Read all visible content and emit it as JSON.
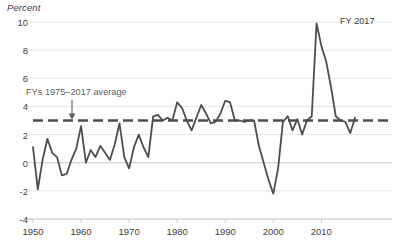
{
  "chart_data": {
    "type": "line",
    "title": "",
    "xlabel": "",
    "ylabel": "Percent",
    "ylim": [
      -4,
      10
    ],
    "xlim": [
      1950,
      2017
    ],
    "yticks": [
      10,
      8,
      6,
      4,
      2,
      0,
      -2,
      -4
    ],
    "ytick_labels": [
      "10",
      "8",
      "6",
      "4",
      "2",
      "0",
      "-2",
      "-4"
    ],
    "xticks": [
      1950,
      1960,
      1970,
      1980,
      1990,
      2000,
      2010
    ],
    "xtick_labels": [
      "1950",
      "1960",
      "1970",
      "1980",
      "1990",
      "2000",
      "2010"
    ],
    "grid": "horizontal",
    "legend": "none",
    "line_color": "#4d4d4d",
    "grid_color": "#e6e6e6",
    "zero_line_color": "#c9c9c9",
    "annotations": [
      {
        "name": "average-annotation",
        "text": "FYs 1975–2017 average",
        "value": 3.0,
        "style": "dashed",
        "color": "#4d4d4d"
      },
      {
        "name": "endpoint-label",
        "text": "FY 2017",
        "x": 2017,
        "color": "#3d3d3d"
      }
    ],
    "series": [
      {
        "name": "annual growth",
        "x": [
          1950,
          1951,
          1952,
          1953,
          1954,
          1955,
          1956,
          1957,
          1958,
          1959,
          1960,
          1961,
          1962,
          1963,
          1964,
          1965,
          1966,
          1967,
          1968,
          1969,
          1970,
          1971,
          1972,
          1973,
          1974,
          1975,
          1976,
          1977,
          1978,
          1979,
          1980,
          1981,
          1982,
          1983,
          1984,
          1985,
          1986,
          1987,
          1988,
          1989,
          1990,
          1991,
          1992,
          1993,
          1994,
          1995,
          1996,
          1997,
          1998,
          1999,
          2000,
          2001,
          2002,
          2003,
          2004,
          2005,
          2006,
          2007,
          2008,
          2009,
          2010,
          2011,
          2012,
          2013,
          2014,
          2015,
          2016,
          2017
        ],
        "values": [
          1.1,
          -1.9,
          0.2,
          1.7,
          0.7,
          0.4,
          -0.9,
          -0.8,
          0.2,
          1.0,
          2.6,
          0.0,
          0.9,
          0.4,
          1.2,
          0.7,
          0.2,
          1.3,
          2.8,
          0.4,
          -0.4,
          1.1,
          2.0,
          1.1,
          0.4,
          3.3,
          3.4,
          3.0,
          3.2,
          3.0,
          4.3,
          3.9,
          3.0,
          2.3,
          3.2,
          4.1,
          3.5,
          2.8,
          2.9,
          3.5,
          4.4,
          4.3,
          3.0,
          3.0,
          2.9,
          3.0,
          3.0,
          1.2,
          0.0,
          -1.2,
          -2.2,
          -0.4,
          2.9,
          3.3,
          2.3,
          3.1,
          2.0,
          3.0,
          3.3,
          9.9,
          8.3,
          7.2,
          5.4,
          3.3,
          3.0,
          2.9,
          2.1,
          3.2
        ]
      }
    ]
  },
  "labels": {
    "axis_title": "Percent"
  }
}
